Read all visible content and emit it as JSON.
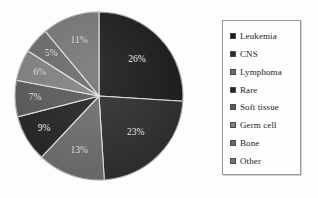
{
  "chart_data": {
    "type": "pie",
    "title": "",
    "labels": [
      "Leukemia",
      "CNS",
      "Lymphoma",
      "Rare",
      "Soft tissue",
      "Germ cell",
      "Bone",
      "Other"
    ],
    "values": [
      26,
      23,
      13,
      9,
      7,
      6,
      5,
      11
    ],
    "value_labels": [
      "26%",
      "23%",
      "13%",
      "9%",
      "7%",
      "6%",
      "5%",
      "11%"
    ],
    "units": "percent",
    "start_angle_deg": 0,
    "direction": "clockwise",
    "legend_position": "right",
    "grid": false,
    "slice_colors": [
      "#1a1a1a",
      "#2e2e2e",
      "#6e6e6e",
      "#242424",
      "#5a5a5a",
      "#828282",
      "#6a6a6a",
      "#767676"
    ],
    "label_color": "#f2f2f0",
    "legend_border_color": "#9a9a9a",
    "background_color": "#fdfdfc"
  },
  "legend": {
    "items": [
      {
        "label": "Leukemia",
        "color": "#1a1a1a"
      },
      {
        "label": "CNS",
        "color": "#2e2e2e"
      },
      {
        "label": "Lymphoma",
        "color": "#6e6e6e"
      },
      {
        "label": "Rare",
        "color": "#242424"
      },
      {
        "label": "Soft tissue",
        "color": "#5a5a5a"
      },
      {
        "label": "Germ cell",
        "color": "#828282"
      },
      {
        "label": "Bone",
        "color": "#6a6a6a"
      },
      {
        "label": "Other",
        "color": "#767676"
      }
    ]
  }
}
